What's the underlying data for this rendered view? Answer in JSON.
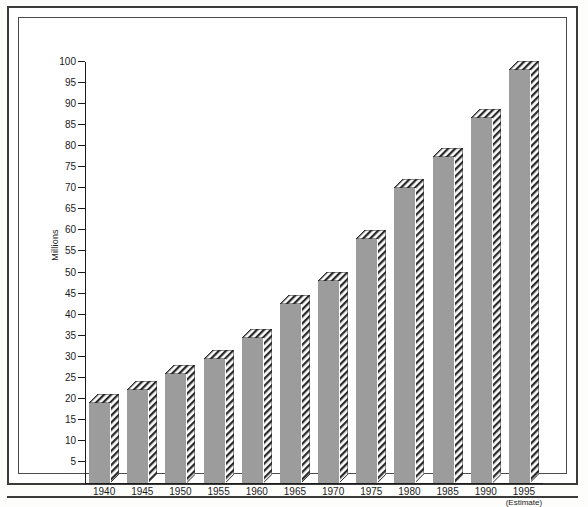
{
  "chart_data": {
    "type": "bar",
    "title": "",
    "xlabel": "",
    "ylabel": "Millions",
    "ylim": [
      0,
      100
    ],
    "ytick_step": 5,
    "grid": false,
    "legend": "none",
    "categories": [
      "1940",
      "1945",
      "1950",
      "1955",
      "1960",
      "1965",
      "1970",
      "1975",
      "1980",
      "1985",
      "1990",
      "1995"
    ],
    "values": [
      19,
      22,
      26,
      29.5,
      34.5,
      42.5,
      48,
      58,
      70,
      77.5,
      86.8,
      98
    ],
    "ytick_labels": [
      "100",
      "95",
      "90",
      "85",
      "80",
      "75",
      "70",
      "65",
      "60",
      "55",
      "50",
      "45",
      "40",
      "35",
      "30",
      "25",
      "20",
      "15",
      "10",
      "5"
    ],
    "annotations": [
      {
        "category": "1995",
        "text": "(Estimate)"
      }
    ],
    "series": [
      {
        "name": "Millions",
        "values": [
          19,
          22,
          26,
          29.5,
          34.5,
          42.5,
          48,
          58,
          70,
          77.5,
          86.8,
          98
        ]
      }
    ]
  },
  "style": {
    "bar_face_color": "#9c9c9c",
    "bar_hatch_color": "#2b2b2b",
    "axis_color": "#1b1b1b",
    "frame_color": "#3b3b3b",
    "background_color": "#ffffff"
  }
}
